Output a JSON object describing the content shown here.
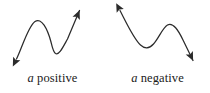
{
  "figure": {
    "background_color": "#ffffff",
    "ink_color": "#2b2b2b",
    "panels": [
      {
        "id": "a-positive",
        "caption_variable": "a",
        "caption_word": "positive",
        "curve_description": "cubic curve rising overall with a local maximum then a local minimum",
        "arrow_style": "double-headed",
        "arrow_start_direction": "down-left",
        "arrow_end_direction": "up-right",
        "points": {
          "start_arrow_tip": [
            13,
            62
          ],
          "local_maximum": [
            38,
            21
          ],
          "local_minimum": [
            53,
            54
          ],
          "end_arrow_tip": [
            82,
            7
          ]
        }
      },
      {
        "id": "a-negative",
        "caption_variable": "a",
        "caption_word": "negative",
        "curve_description": "cubic curve falling overall with a local minimum then a local maximum",
        "arrow_style": "double-headed",
        "arrow_start_direction": "up-left",
        "arrow_end_direction": "down-right",
        "points": {
          "start_arrow_tip": [
            12,
            7
          ],
          "local_minimum": [
            43,
            48
          ],
          "local_maximum": [
            63,
            25
          ],
          "end_arrow_tip": [
            91,
            64
          ]
        }
      }
    ]
  }
}
